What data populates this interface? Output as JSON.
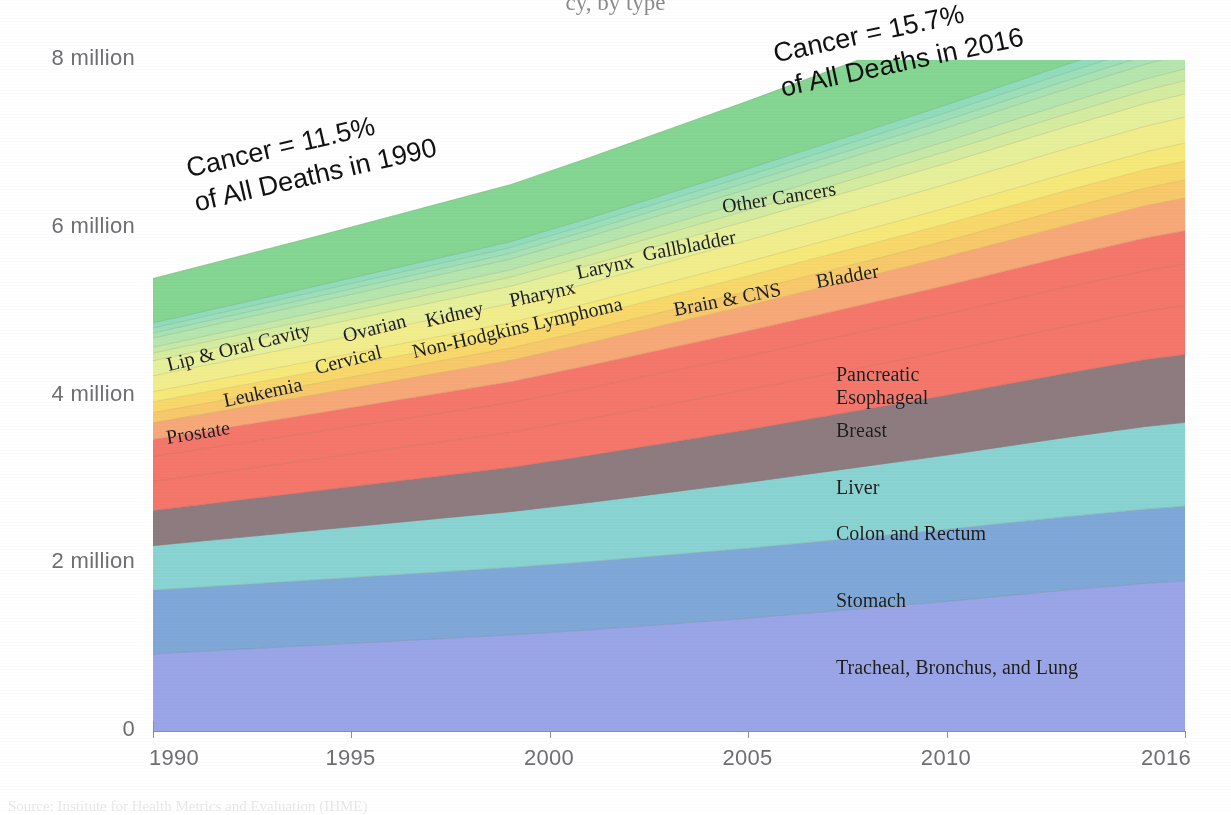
{
  "figure": {
    "partial_title": "cy, by type",
    "source_note": "Source: Institute for Health Metrics and Evaluation (IHME)"
  },
  "chart_data": {
    "type": "area",
    "title": "",
    "subtitle": "",
    "xlabel": "",
    "ylabel": "",
    "stacked": true,
    "grid": false,
    "legend_position": "inline-labels",
    "x": [
      1990,
      1991,
      1992,
      1993,
      1994,
      1995,
      1996,
      1997,
      1998,
      1999,
      2000,
      2001,
      2002,
      2003,
      2004,
      2005,
      2006,
      2007,
      2008,
      2009,
      2010,
      2011,
      2012,
      2013,
      2014,
      2015,
      2016
    ],
    "xlim": [
      1990,
      2016
    ],
    "ylim": [
      0,
      8000000
    ],
    "xticks": [
      1990,
      1995,
      2000,
      2005,
      2010,
      2016
    ],
    "xtick_labels": [
      "1990",
      "1995",
      "2000",
      "2005",
      "2010",
      "2016"
    ],
    "yticks": [
      0,
      2000000,
      4000000,
      6000000,
      8000000
    ],
    "ytick_labels": [
      "0",
      "2 million",
      "4 million",
      "6 million",
      "8 million"
    ],
    "annotations": [
      {
        "id": "ann-1990",
        "line1": "Cancer = 11.5%",
        "line2": "of All Deaths in 1990",
        "value_percent": 11.5,
        "year": 1990
      },
      {
        "id": "ann-2016",
        "line1": "Cancer = 15.7%",
        "line2": "of All Deaths in 2016",
        "value_percent": 15.7,
        "year": 2016
      }
    ],
    "series": [
      {
        "name": "Tracheal, Bronchus, and Lung",
        "color": "#9aa5e8",
        "values": [
          920000,
          945000,
          970000,
          995000,
          1020000,
          1045000,
          1070000,
          1095000,
          1120000,
          1145000,
          1175000,
          1205000,
          1240000,
          1275000,
          1310000,
          1345000,
          1385000,
          1425000,
          1465000,
          1505000,
          1545000,
          1590000,
          1635000,
          1680000,
          1720000,
          1760000,
          1790000
        ]
      },
      {
        "name": "Stomach",
        "color": "#7fa8d8",
        "values": [
          760000,
          765000,
          770000,
          775000,
          780000,
          785000,
          790000,
          795000,
          800000,
          805000,
          810000,
          815000,
          820000,
          825000,
          830000,
          835000,
          840000,
          845000,
          850000,
          855000,
          860000,
          865000,
          870000,
          875000,
          880000,
          885000,
          890000
        ]
      },
      {
        "name": "Colon and Rectum",
        "color": "#8ad3d3",
        "values": [
          530000,
          545000,
          560000,
          575000,
          590000,
          605000,
          620000,
          635000,
          650000,
          665000,
          685000,
          705000,
          725000,
          745000,
          765000,
          785000,
          805000,
          825000,
          845000,
          865000,
          885000,
          905000,
          925000,
          945000,
          965000,
          985000,
          1000000
        ]
      },
      {
        "name": "Liver",
        "color": "#8d7b7f",
        "values": [
          420000,
          432000,
          444000,
          456000,
          468000,
          480000,
          492000,
          504000,
          516000,
          528000,
          545000,
          562000,
          579000,
          596000,
          613000,
          630000,
          647000,
          664000,
          681000,
          698000,
          715000,
          732000,
          749000,
          766000,
          783000,
          800000,
          810000
        ]
      },
      {
        "name": "Breast",
        "color": "#f5766a",
        "values": [
          345000,
          353000,
          361000,
          369000,
          377000,
          385000,
          393000,
          401000,
          409000,
          417000,
          427000,
          437000,
          447000,
          457000,
          467000,
          477000,
          487000,
          497000,
          507000,
          517000,
          527000,
          537000,
          547000,
          557000,
          567000,
          577000,
          585000
        ]
      },
      {
        "name": "Esophageal",
        "color": "#f5766a",
        "values": [
          300000,
          306000,
          312000,
          318000,
          324000,
          330000,
          336000,
          342000,
          348000,
          354000,
          362000,
          370000,
          378000,
          386000,
          394000,
          402000,
          410000,
          418000,
          426000,
          434000,
          442000,
          450000,
          458000,
          466000,
          474000,
          482000,
          490000
        ]
      },
      {
        "name": "Pancreatic",
        "color": "#f5766a",
        "values": [
          200000,
          205000,
          210000,
          215000,
          220000,
          226000,
          232000,
          238000,
          244000,
          250000,
          258000,
          266000,
          274000,
          282000,
          290000,
          298000,
          306000,
          314000,
          322000,
          330000,
          340000,
          350000,
          360000,
          370000,
          380000,
          390000,
          400000
        ]
      },
      {
        "name": "Prostate",
        "color": "#f7a878",
        "values": [
          200000,
          206000,
          212000,
          218000,
          224000,
          230000,
          236000,
          242000,
          248000,
          254000,
          262000,
          270000,
          278000,
          286000,
          294000,
          302000,
          310000,
          318000,
          326000,
          334000,
          342000,
          350000,
          358000,
          366000,
          374000,
          382000,
          390000
        ]
      },
      {
        "name": "Bladder",
        "color": "#f8c96a",
        "values": [
          120000,
          123000,
          126000,
          129000,
          132000,
          135000,
          138000,
          141000,
          144000,
          147000,
          151000,
          155000,
          159000,
          163000,
          167000,
          171000,
          175000,
          179000,
          183000,
          187000,
          191000,
          195000,
          199000,
          203000,
          207000,
          211000,
          215000
        ]
      },
      {
        "name": "Brain & CNS",
        "color": "#f8d86a",
        "values": [
          130000,
          133000,
          136000,
          139000,
          142000,
          145000,
          148000,
          151000,
          154000,
          157000,
          161000,
          165000,
          169000,
          173000,
          177000,
          181000,
          185000,
          189000,
          193000,
          197000,
          201000,
          205000,
          209000,
          213000,
          217000,
          221000,
          225000
        ]
      },
      {
        "name": "Non-Hodgkins Lymphoma",
        "color": "#f6e97a",
        "values": [
          120000,
          123000,
          126000,
          129000,
          132000,
          135000,
          138000,
          141000,
          144000,
          147000,
          151000,
          155000,
          159000,
          163000,
          167000,
          171000,
          175000,
          179000,
          183000,
          187000,
          191000,
          195000,
          199000,
          203000,
          207000,
          211000,
          215000
        ]
      },
      {
        "name": "Leukemia",
        "color": "#f2ed8c",
        "values": [
          190000,
          194000,
          198000,
          202000,
          206000,
          210000,
          214000,
          218000,
          222000,
          226000,
          231000,
          236000,
          241000,
          246000,
          251000,
          256000,
          261000,
          266000,
          271000,
          276000,
          281000,
          286000,
          291000,
          296000,
          301000,
          306000,
          310000
        ]
      },
      {
        "name": "Cervical",
        "color": "#e6ef9a",
        "values": [
          180000,
          183000,
          186000,
          189000,
          192000,
          195000,
          198000,
          201000,
          204000,
          207000,
          211000,
          215000,
          219000,
          223000,
          227000,
          231000,
          235000,
          239000,
          243000,
          247000,
          251000,
          255000,
          259000,
          263000,
          267000,
          271000,
          275000
        ]
      },
      {
        "name": "Ovarian",
        "color": "#d5ecA0",
        "values": [
          90000,
          92000,
          94000,
          96000,
          98000,
          100000,
          102000,
          104000,
          106000,
          108000,
          111000,
          114000,
          117000,
          120000,
          123000,
          126000,
          129000,
          132000,
          135000,
          138000,
          141000,
          144000,
          147000,
          150000,
          153000,
          156000,
          160000
        ]
      },
      {
        "name": "Kidney",
        "color": "#c6e9a8",
        "values": [
          70000,
          72000,
          74000,
          76000,
          78000,
          80000,
          82000,
          84000,
          86000,
          88000,
          91000,
          94000,
          97000,
          100000,
          103000,
          106000,
          109000,
          112000,
          115000,
          118000,
          121000,
          124000,
          127000,
          130000,
          133000,
          136000,
          140000
        ]
      },
      {
        "name": "Lip & Oral Cavity",
        "color": "#b6e5ae",
        "values": [
          110000,
          112000,
          114000,
          116000,
          118000,
          120000,
          122000,
          124000,
          126000,
          128000,
          131000,
          134000,
          137000,
          140000,
          143000,
          146000,
          149000,
          152000,
          155000,
          158000,
          161000,
          164000,
          167000,
          170000,
          173000,
          176000,
          180000
        ]
      },
      {
        "name": "Pharynx",
        "color": "#a9e2b4",
        "values": [
          60000,
          61000,
          62000,
          63000,
          64000,
          65000,
          66000,
          67000,
          68000,
          69000,
          71000,
          73000,
          75000,
          77000,
          79000,
          81000,
          83000,
          85000,
          87000,
          89000,
          91000,
          93000,
          95000,
          97000,
          99000,
          101000,
          103000
        ]
      },
      {
        "name": "Larynx",
        "color": "#9cdfb8",
        "values": [
          60000,
          61000,
          62000,
          63000,
          64000,
          65000,
          66000,
          67000,
          68000,
          69000,
          71000,
          73000,
          75000,
          77000,
          79000,
          81000,
          83000,
          85000,
          87000,
          89000,
          91000,
          93000,
          95000,
          97000,
          99000,
          101000,
          103000
        ]
      },
      {
        "name": "Gallbladder",
        "color": "#91dcbd",
        "values": [
          60000,
          61000,
          62000,
          63000,
          64000,
          65000,
          66000,
          67000,
          68000,
          69000,
          71000,
          73000,
          75000,
          77000,
          79000,
          81000,
          83000,
          85000,
          87000,
          89000,
          91000,
          93000,
          95000,
          97000,
          99000,
          101000,
          103000
        ]
      },
      {
        "name": "Other Cancers",
        "color": "#84d692",
        "values": [
          530000,
          545000,
          560000,
          575000,
          590000,
          608000,
          626000,
          644000,
          662000,
          680000,
          700000,
          720000,
          742000,
          764000,
          786000,
          808000,
          832000,
          856000,
          880000,
          904000,
          930000,
          956000,
          982000,
          1008000,
          1034000,
          1060000,
          1080000
        ]
      }
    ],
    "inline_labels": [
      {
        "text": "Prostate",
        "x": 168,
        "y": 426,
        "rot": -9,
        "size": 20
      },
      {
        "text": "Leukemia",
        "x": 226,
        "y": 389,
        "rot": -12,
        "size": 20
      },
      {
        "text": "Lip & Oral Cavity",
        "x": 170,
        "y": 353,
        "rot": -14,
        "size": 20
      },
      {
        "text": "Cervical",
        "x": 318,
        "y": 356,
        "rot": -14,
        "size": 20
      },
      {
        "text": "Ovarian",
        "x": 346,
        "y": 324,
        "rot": -14,
        "size": 20
      },
      {
        "text": "Kidney",
        "x": 428,
        "y": 309,
        "rot": -13,
        "size": 20
      },
      {
        "text": "Non-Hodgkins Lymphoma",
        "x": 415,
        "y": 340,
        "rot": -13,
        "size": 20
      },
      {
        "text": "Pharynx",
        "x": 512,
        "y": 289,
        "rot": -12,
        "size": 20
      },
      {
        "text": "Larynx",
        "x": 579,
        "y": 261,
        "rot": -12,
        "size": 20
      },
      {
        "text": "Gallbladder",
        "x": 645,
        "y": 243,
        "rot": -11,
        "size": 20
      },
      {
        "text": "Brain & CNS",
        "x": 676,
        "y": 298,
        "rot": -11,
        "size": 20
      },
      {
        "text": "Bladder",
        "x": 818,
        "y": 270,
        "rot": -10,
        "size": 20
      },
      {
        "text": "Other Cancers",
        "x": 724,
        "y": 195,
        "rot": -9,
        "size": 20
      },
      {
        "text": "Pancreatic",
        "x": 836,
        "y": 363,
        "rot": 0,
        "size": 20
      },
      {
        "text": "Esophageal",
        "x": 836,
        "y": 386,
        "rot": 0,
        "size": 20
      },
      {
        "text": "Breast",
        "x": 836,
        "y": 419,
        "rot": 0,
        "size": 20
      },
      {
        "text": "Liver",
        "x": 836,
        "y": 476,
        "rot": 0,
        "size": 20
      },
      {
        "text": "Colon and Rectum",
        "x": 836,
        "y": 522,
        "rot": 0,
        "size": 20
      },
      {
        "text": "Stomach",
        "x": 836,
        "y": 589,
        "rot": 0,
        "size": 20
      },
      {
        "text": "Tracheal, Bronchus, and Lung",
        "x": 836,
        "y": 656,
        "rot": 0,
        "size": 20
      }
    ]
  },
  "colors": {
    "axis": "#8e8e93",
    "tick_text": "#6e6e73",
    "label_text": "#1c1c1c",
    "background": "#ffffff"
  }
}
